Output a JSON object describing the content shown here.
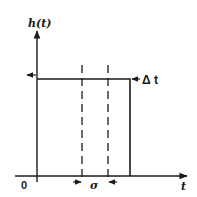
{
  "diagram": {
    "type": "rectangular pulse response",
    "y_axis_label": "h(t)",
    "x_axis_label": "t",
    "origin_label": "0",
    "width_annotation": "σ",
    "height_annotation": "Δ t",
    "colors": {
      "ink": "#1a1a1a",
      "background": "#ffffff"
    }
  }
}
